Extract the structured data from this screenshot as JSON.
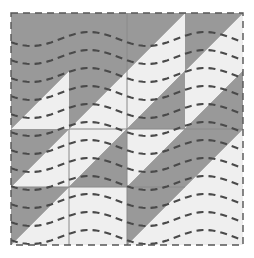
{
  "figure": {
    "kind": "quilt-block",
    "background_color": "#ffffff"
  },
  "canvas": {
    "width": 254,
    "height": 258
  },
  "block": {
    "name": "half-square-triangle-block",
    "origin_x": 11,
    "origin_y": 13,
    "size": 232,
    "grid_rows": 4,
    "grid_cols": 4,
    "cell_size": 58,
    "dark_color": "#999999",
    "light_color": "#efefef",
    "seam_line_color": "#8a8a8a",
    "seam_line_width": 1
  },
  "border": {
    "name": "dashed-outline",
    "color": "#555555",
    "width": 1.4,
    "dash": "7 5"
  },
  "quilting": {
    "name": "wavy-dashed-quilting-lines",
    "color": "#4a4a4a",
    "width": 2.1,
    "dash": "7 5",
    "line_count": 13,
    "spacing": 18,
    "first_y": 26,
    "amplitude": 7,
    "wavelength": 116
  },
  "cells": [
    {
      "row": 0,
      "col": 0,
      "split": "none",
      "fill": "dark",
      "label": "cell-r0c0-solid-dark"
    },
    {
      "row": 0,
      "col": 1,
      "split": "none",
      "fill": "dark",
      "label": "cell-r0c1-solid-dark"
    },
    {
      "row": 0,
      "col": 2,
      "split": "anti",
      "upper": "dark",
      "lower": "light",
      "label": "cell-r0c2-hst"
    },
    {
      "row": 0,
      "col": 3,
      "split": "anti",
      "upper": "dark",
      "lower": "light",
      "label": "cell-r0c3-hst"
    },
    {
      "row": 1,
      "col": 0,
      "split": "anti",
      "upper": "dark",
      "lower": "light",
      "label": "cell-r1c0-hst"
    },
    {
      "row": 1,
      "col": 1,
      "split": "anti",
      "upper": "dark",
      "lower": "light",
      "label": "cell-r1c1-hst"
    },
    {
      "row": 1,
      "col": 2,
      "split": "anti",
      "upper": "light",
      "lower": "dark",
      "label": "cell-r1c2-hst"
    },
    {
      "row": 1,
      "col": 3,
      "split": "anti",
      "upper": "light",
      "lower": "dark",
      "label": "cell-r1c3-hst"
    },
    {
      "row": 2,
      "col": 0,
      "split": "anti",
      "upper": "dark",
      "lower": "light",
      "label": "cell-r2c0-hst"
    },
    {
      "row": 2,
      "col": 1,
      "split": "anti",
      "upper": "light",
      "lower": "dark",
      "label": "cell-r2c1-hst"
    },
    {
      "row": 2,
      "col": 2,
      "split": "anti",
      "upper": "light",
      "lower": "dark",
      "label": "cell-r2c2-hst"
    },
    {
      "row": 2,
      "col": 3,
      "split": "anti",
      "upper": "dark",
      "lower": "light",
      "label": "cell-r2c3-hst"
    },
    {
      "row": 3,
      "col": 0,
      "split": "anti",
      "upper": "dark",
      "lower": "light",
      "label": "cell-r3c0-hst"
    },
    {
      "row": 3,
      "col": 1,
      "split": "none",
      "fill": "light",
      "label": "cell-r3c1-solid-light"
    },
    {
      "row": 3,
      "col": 2,
      "split": "anti",
      "upper": "dark",
      "lower": "light",
      "label": "cell-r3c2-hst"
    },
    {
      "row": 3,
      "col": 3,
      "split": "none",
      "fill": "light",
      "label": "cell-r3c3-solid-light"
    }
  ],
  "seams": {
    "vertical_x": [
      69,
      127,
      185
    ],
    "horizontal_y": [
      71,
      129,
      187
    ],
    "visible_segments": [
      {
        "name": "seam-v-center-full",
        "x1": 127,
        "y1": 13,
        "x2": 127,
        "y2": 245
      },
      {
        "name": "seam-v-left-lower",
        "x1": 69,
        "y1": 129,
        "x2": 69,
        "y2": 245
      },
      {
        "name": "seam-h-mid-upper",
        "x1": 69,
        "y1": 129,
        "x2": 243,
        "y2": 129
      },
      {
        "name": "seam-h-mid-lower",
        "x1": 11,
        "y1": 187,
        "x2": 185,
        "y2": 187
      }
    ]
  }
}
